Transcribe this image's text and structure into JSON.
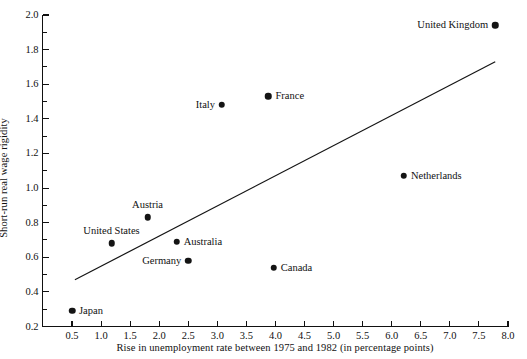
{
  "chart_data": {
    "type": "scatter",
    "title": "",
    "xlabel": "Rise in unemployment rate between 1975 and 1982 (in percentage points)",
    "ylabel": "Short-run real wage rigidity",
    "xlim": [
      0.2,
      8.0
    ],
    "ylim": [
      0.2,
      2.0
    ],
    "xticks": [
      "0.5",
      "1.0",
      "1.5",
      "2.0",
      "2.5",
      "3.0",
      "3.5",
      "4.0",
      "4.5",
      "5.0",
      "5.5",
      "6.0",
      "6.5",
      "7.0",
      "7.5",
      "8.0"
    ],
    "xtick_values": [
      0.5,
      1.0,
      1.5,
      2.0,
      2.5,
      3.0,
      3.5,
      4.0,
      4.5,
      5.0,
      5.5,
      6.0,
      6.5,
      7.0,
      7.5,
      8.0
    ],
    "yticks": [
      "0.2",
      "0.4",
      "0.6",
      "0.8",
      "1.0",
      "1.2",
      "1.4",
      "1.6",
      "1.8",
      "2.0"
    ],
    "ytick_values": [
      0.2,
      0.4,
      0.6,
      0.8,
      1.0,
      1.2,
      1.4,
      1.6,
      1.8,
      2.0
    ],
    "y_minor_ticks": [
      0.3,
      0.5,
      0.7,
      0.9,
      1.1,
      1.3,
      1.5,
      1.7,
      1.9
    ],
    "grid": false,
    "legend": "none",
    "marker_color": "#141414",
    "line_color": "#141414",
    "axis_color": "#111111",
    "points": [
      {
        "label": "Japan",
        "x": 0.5,
        "y": 0.29,
        "label_pos": "right"
      },
      {
        "label": "United States",
        "x": 1.18,
        "y": 0.68,
        "label_pos": "above"
      },
      {
        "label": "Austria",
        "x": 1.8,
        "y": 0.83,
        "label_pos": "above"
      },
      {
        "label": "Australia",
        "x": 2.3,
        "y": 0.69,
        "label_pos": "right"
      },
      {
        "label": "Germany",
        "x": 2.5,
        "y": 0.58,
        "label_pos": "left"
      },
      {
        "label": "Italy",
        "x": 3.08,
        "y": 1.48,
        "label_pos": "left"
      },
      {
        "label": "France",
        "x": 3.88,
        "y": 1.53,
        "label_pos": "right"
      },
      {
        "label": "Canada",
        "x": 3.97,
        "y": 0.54,
        "label_pos": "right"
      },
      {
        "label": "Netherlands",
        "x": 6.21,
        "y": 1.07,
        "label_pos": "right"
      },
      {
        "label": "United Kingdom",
        "x": 7.78,
        "y": 1.94,
        "label_pos": "left"
      }
    ],
    "trend_line": {
      "x_start": 0.55,
      "y_start": 0.47,
      "x_end": 7.78,
      "y_end": 1.73
    }
  }
}
